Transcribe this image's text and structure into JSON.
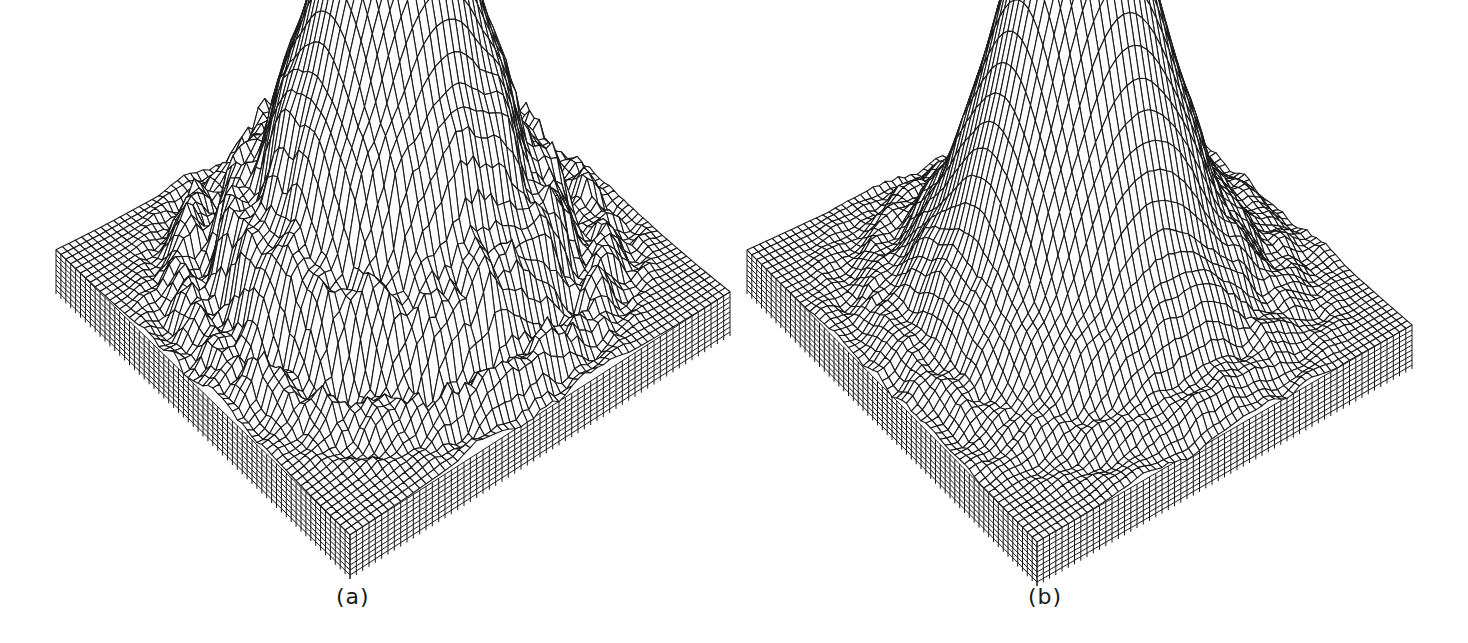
{
  "figure": {
    "background": "#ffffff",
    "line_color": "#1a1a1a",
    "panels": [
      {
        "id": "a",
        "label": "(a)",
        "label_x": 336
      },
      {
        "id": "b",
        "label": "(b)",
        "label_x": 1028
      }
    ]
  },
  "chart_data": [
    {
      "type": "surface-wireframe",
      "title": "",
      "label": "(a)",
      "description": "3D wireframe surface plot: single central Gaussian-like peak with noisy ripples around the base on a flat square grid",
      "grid_size": 60,
      "peak_height": 1.0,
      "peak_width": 0.18,
      "noise_amplitude": 0.06,
      "noise_ring_radius": [
        0.25,
        0.55
      ],
      "projection": {
        "left_top": [
          56,
          250
        ],
        "back": [
          440,
          63
        ],
        "right_top": [
          730,
          292
        ],
        "front": [
          350,
          535
        ],
        "base_thickness": 44,
        "height_scale": 470
      },
      "xlabel": "",
      "ylabel": "",
      "zlabel": "",
      "grid": false
    },
    {
      "type": "surface-wireframe",
      "title": "",
      "label": "(b)",
      "description": "3D wireframe surface plot: single central smooth peak, reduced noise around base on flat square grid, one small bump near right edge",
      "grid_size": 60,
      "peak_height": 1.0,
      "peak_width": 0.17,
      "noise_amplitude": 0.02,
      "noise_ring_radius": [
        0.25,
        0.6
      ],
      "small_bump": {
        "u": 0.22,
        "v": 0.88,
        "height": 0.08
      },
      "projection": {
        "left_top": [
          747,
          250
        ],
        "back": [
          1125,
          80
        ],
        "right_top": [
          1412,
          325
        ],
        "front": [
          1037,
          542
        ],
        "base_thickness": 44,
        "height_scale": 480
      },
      "xlabel": "",
      "ylabel": "",
      "zlabel": "",
      "grid": false
    }
  ]
}
